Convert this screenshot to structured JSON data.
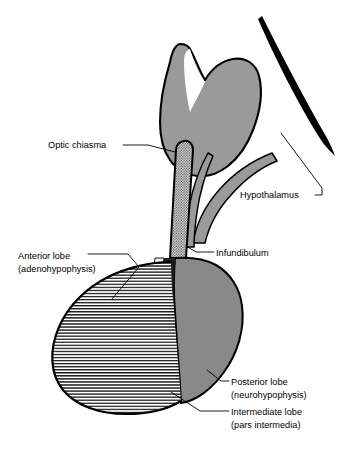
{
  "figure": {
    "background": "#ffffff",
    "width": 340,
    "height": 455
  },
  "colors": {
    "outline": "#000000",
    "brain_gray": "#9a9a9a",
    "posterior_gray": "#898989",
    "intermediate_dark": "#1e1e1e",
    "intermediate_light": "#f2f2f2",
    "anterior_fill": "#ffffff",
    "hatch_line": "#1a1a1a",
    "stalk_stipple": "#3a3a3a",
    "leader_line": "#000000",
    "text": "#000000"
  },
  "labels": [
    {
      "id": "optic-chiasma",
      "lines": [
        "Optic chiasma"
      ],
      "x": 48,
      "y": 148,
      "anchor": "start"
    },
    {
      "id": "hypothalamus",
      "lines": [
        "Hypothalamus"
      ],
      "x": 240,
      "y": 198,
      "anchor": "start"
    },
    {
      "id": "infundibulum",
      "lines": [
        "Infundibulum"
      ],
      "x": 216,
      "y": 256,
      "anchor": "start"
    },
    {
      "id": "anterior-lobe",
      "lines": [
        "Anterior lobe",
        "(adenohypophysis)"
      ],
      "x": 18,
      "y": 259,
      "anchor": "start"
    },
    {
      "id": "posterior-lobe",
      "lines": [
        "Posterior lobe",
        "(neurohypophysis)"
      ],
      "x": 231,
      "y": 385,
      "anchor": "start"
    },
    {
      "id": "intermediate-lobe",
      "lines": [
        "Intermediate lobe",
        "(pars intermedia)"
      ],
      "x": 231,
      "y": 415,
      "anchor": "start"
    }
  ],
  "structures": [
    {
      "id": "optic-chiasma-body",
      "name": "optic chiasma"
    },
    {
      "id": "hypothalamus-band",
      "name": "hypothalamus"
    },
    {
      "id": "infundibulum-stalk",
      "name": "infundibulum"
    },
    {
      "id": "anterior-lobe-region",
      "name": "anterior lobe (adenohypophysis)"
    },
    {
      "id": "intermediate-lobe-region",
      "name": "intermediate lobe (pars intermedia)"
    },
    {
      "id": "posterior-lobe-region",
      "name": "posterior lobe (neurohypophysis)"
    },
    {
      "id": "brainstem-arc",
      "name": "brainstem outline arc"
    }
  ]
}
